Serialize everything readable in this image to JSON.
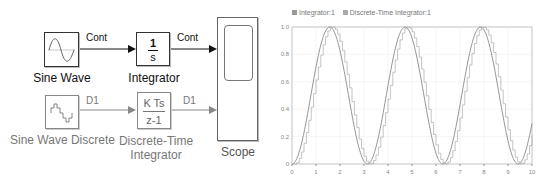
{
  "diagram": {
    "blocks": [
      {
        "id": "sine-wave",
        "label": "Sine Wave"
      },
      {
        "id": "integrator",
        "label": "Integrator",
        "numerator": "1",
        "denominator": "s"
      },
      {
        "id": "sine-wave-discrete",
        "label": "Sine Wave Discrete"
      },
      {
        "id": "discrete-time-integrator",
        "label_line1": "Discrete-Time",
        "label_line2": "Integrator",
        "numerator": "K Ts",
        "denominator": "z-1"
      },
      {
        "id": "scope",
        "label": "Scope"
      }
    ],
    "signals": {
      "sine_to_integrator": "Cont",
      "integrator_to_scope": "Cont",
      "discrete_sine_to_dti": "D1",
      "dti_to_scope": "D1"
    },
    "colors": {
      "continuous": "#111111",
      "discrete": "#888888"
    }
  },
  "chart_data": {
    "type": "line",
    "title": "",
    "legend": [
      "Integrator:1",
      "Discrete-Time Integrator:1"
    ],
    "legend_position": "top-left",
    "xlabel": "",
    "ylabel": "",
    "xlim": [
      0,
      10
    ],
    "ylim": [
      0,
      1.0
    ],
    "x_ticks": [
      "0",
      "1",
      "2",
      "3",
      "4",
      "5",
      "6",
      "7",
      "8",
      "9",
      "10"
    ],
    "y_ticks": [
      "0",
      "0.2",
      "0.4",
      "0.6",
      "0.8",
      "1.0"
    ],
    "grid": true,
    "series": [
      {
        "name": "Integrator:1",
        "style": "continuous",
        "x": [
          0,
          0.5,
          1,
          1.5,
          1.57,
          2,
          2.5,
          3,
          3.14,
          3.5,
          4,
          4.5,
          4.71,
          5,
          5.5,
          6,
          6.28,
          6.5,
          7,
          7.5,
          7.85,
          8,
          8.5,
          9,
          9.42,
          9.5,
          10
        ],
        "values": [
          0,
          0.23,
          0.71,
          0.99,
          1.0,
          0.83,
          0.36,
          0.02,
          0,
          0.12,
          0.57,
          0.96,
          1.0,
          0.92,
          0.5,
          0.08,
          0,
          0.05,
          0.43,
          0.88,
          1.0,
          0.98,
          0.64,
          0.17,
          0,
          0.01,
          0.3
        ]
      },
      {
        "name": "Discrete-Time Integrator:1",
        "style": "staircase",
        "step": 0.1,
        "description": "zero-order-hold staircase lagging the continuous curve by one sample"
      }
    ]
  }
}
